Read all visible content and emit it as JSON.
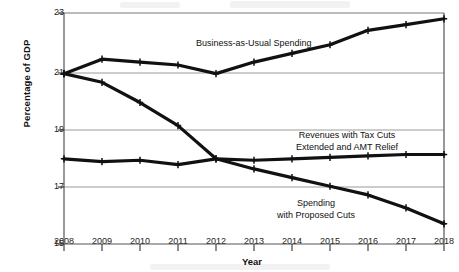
{
  "chart_data": {
    "type": "line",
    "title": "",
    "xlabel": "Year",
    "ylabel": "Percentage of GDP",
    "x": [
      2008,
      2009,
      2010,
      2011,
      2012,
      2013,
      2014,
      2015,
      2016,
      2017,
      2018
    ],
    "xtick_labels": [
      "2008",
      "2009",
      "2010",
      "2011",
      "2012",
      "2013",
      "2014",
      "2015",
      "2016",
      "2017",
      "2018"
    ],
    "ytick_labels": [
      "15",
      "17",
      "19",
      "21",
      "23"
    ],
    "ytick_values": [
      15,
      17,
      19,
      21,
      23
    ],
    "ylim": [
      15,
      23
    ],
    "xlim": [
      2008,
      2018
    ],
    "grid": true,
    "grid_axis": "y",
    "legend": "inline-annotations",
    "series": [
      {
        "name": "Business-as-Usual Spending",
        "label": "Business-as-Usual Spending",
        "label_lines": [
          "Business-as-Usual Spending"
        ],
        "values": [
          20.9,
          21.4,
          21.3,
          21.2,
          20.9,
          21.3,
          21.6,
          21.9,
          22.4,
          22.6,
          22.8
        ],
        "color": "#111111"
      },
      {
        "name": "Revenues with Tax Cuts Extended and AMT Relief",
        "label": "Revenues with Tax Cuts Extended and AMT Relief",
        "label_lines": [
          "Revenues with Tax Cuts",
          "Extended and AMT Relief"
        ],
        "values": [
          17.95,
          17.85,
          17.9,
          17.75,
          17.95,
          17.9,
          17.95,
          18.0,
          18.05,
          18.1,
          18.1
        ],
        "color": "#111111"
      },
      {
        "name": "Spending with Proposed Cuts",
        "label": "Spending with Proposed Cuts",
        "label_lines": [
          "Spending",
          "with Proposed Cuts"
        ],
        "values": [
          20.9,
          20.6,
          19.9,
          19.1,
          17.95,
          17.6,
          17.3,
          17.0,
          16.7,
          16.25,
          15.7
        ],
        "color": "#111111"
      }
    ]
  },
  "plot": {
    "axis_color": "#555555",
    "grid_color": "#9a9a9a",
    "line_color": "#111111",
    "background": "#ffffff"
  }
}
